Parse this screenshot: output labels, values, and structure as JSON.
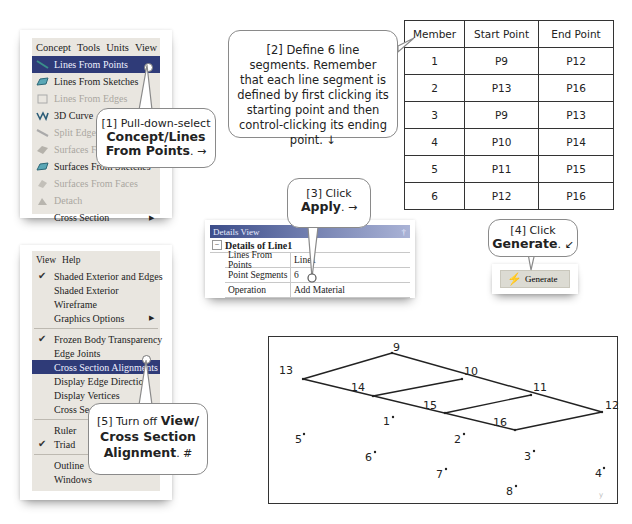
{
  "concept_menu": {
    "menubar": [
      "Concept",
      "Tools",
      "Units",
      "View"
    ],
    "items": [
      {
        "label": "Lines From Points",
        "state": "selected",
        "icon": "line-icon"
      },
      {
        "label": "Lines From Sketches",
        "state": "enabled",
        "icon": "sketch-lines-icon"
      },
      {
        "label": "Lines From Edges",
        "state": "disabled",
        "icon": "edge-lines-icon"
      },
      {
        "label": "3D Curve",
        "state": "enabled",
        "icon": "curve-icon"
      },
      {
        "label": "Split Edges",
        "state": "disabled",
        "icon": "split-edges-icon"
      },
      {
        "label": "Surfaces From Edges",
        "state": "disabled",
        "icon": "surface-edges-icon"
      },
      {
        "label": "Surfaces From Sketches",
        "state": "enabled",
        "icon": "surface-sketch-icon"
      },
      {
        "label": "Surfaces From Faces",
        "state": "disabled",
        "icon": "surface-faces-icon"
      },
      {
        "label": "Detach",
        "state": "disabled",
        "icon": "detach-icon"
      },
      {
        "label": "Cross Section",
        "state": "enabled",
        "submenu": true
      }
    ]
  },
  "view_menu": {
    "menubar": [
      "View",
      "Help"
    ],
    "groups": [
      [
        {
          "label": "Shaded Exterior and Edges",
          "checked": true
        },
        {
          "label": "Shaded Exterior",
          "checked": false
        },
        {
          "label": "Wireframe",
          "checked": false
        },
        {
          "label": "Graphics Options",
          "checked": false,
          "submenu": true
        }
      ],
      [
        {
          "label": "Frozen Body Transparency",
          "checked": true
        },
        {
          "label": "Edge Joints",
          "checked": false
        },
        {
          "label": "Cross Section Alignments",
          "checked": false,
          "selected": true
        },
        {
          "label": "Display Edge Direction",
          "checked": false
        },
        {
          "label": "Display Vertices",
          "checked": false
        },
        {
          "label": "Cross Section Solids",
          "checked": false
        }
      ],
      [
        {
          "label": "Ruler",
          "checked": false
        },
        {
          "label": "Triad",
          "checked": true
        }
      ],
      [
        {
          "label": "Outline",
          "checked": false
        },
        {
          "label": "Windows",
          "checked": false
        }
      ]
    ]
  },
  "callouts": {
    "c1": {
      "line1": "[1] Pull-down-select",
      "bold": "Concept/Lines From Points",
      "tail": ". →"
    },
    "c2": {
      "text": "[2] Define 6 line segments. Remember that each line segment is defined by first clicking its starting point and then control-clicking its ending point. ↓"
    },
    "c3": {
      "line1": "[3] Click",
      "bold": "Apply",
      "tail": ". →"
    },
    "c4": {
      "line1": "[4] Click",
      "bold": "Generate",
      "tail": ". ↙"
    },
    "c5": {
      "line1": "[5] Turn off ",
      "bold1": "View/",
      "bold2": "Cross Section",
      "bold3": "Alignment",
      "tail": ". #"
    }
  },
  "members_table": {
    "headers": [
      "Member",
      "Start Point",
      "End Point"
    ],
    "rows": [
      [
        "1",
        "P9",
        "P12"
      ],
      [
        "2",
        "P13",
        "P16"
      ],
      [
        "3",
        "P9",
        "P13"
      ],
      [
        "4",
        "P10",
        "P14"
      ],
      [
        "5",
        "P11",
        "P15"
      ],
      [
        "6",
        "P12",
        "P16"
      ]
    ]
  },
  "details_view": {
    "title": "Details View",
    "pin": "†",
    "section": "Details of Line1",
    "rows": [
      {
        "label": "Lines From Points",
        "value": "Line1"
      },
      {
        "label": "Point Segments",
        "value": "6"
      },
      {
        "label": "Operation",
        "value": "Add Material"
      }
    ]
  },
  "generate_button": {
    "label": "Generate"
  },
  "point_diagram": {
    "points": [
      {
        "id": "9",
        "x": 123,
        "y": 16
      },
      {
        "id": "10",
        "x": 193,
        "y": 42
      },
      {
        "id": "11",
        "x": 262,
        "y": 58
      },
      {
        "id": "12",
        "x": 333,
        "y": 75
      },
      {
        "id": "13",
        "x": 34,
        "y": 42
      },
      {
        "id": "14",
        "x": 104,
        "y": 59
      },
      {
        "id": "15",
        "x": 176,
        "y": 76
      },
      {
        "id": "16",
        "x": 246,
        "y": 93
      },
      {
        "id": "1",
        "x": 124,
        "y": 80
      },
      {
        "id": "2",
        "x": 195,
        "y": 97
      },
      {
        "id": "3",
        "x": 265,
        "y": 114
      },
      {
        "id": "4",
        "x": 335,
        "y": 131
      },
      {
        "id": "5",
        "x": 35,
        "y": 97
      },
      {
        "id": "6",
        "x": 106,
        "y": 115
      },
      {
        "id": "7",
        "x": 177,
        "y": 132
      },
      {
        "id": "8",
        "x": 247,
        "y": 149
      }
    ],
    "segments": [
      [
        "9",
        "12"
      ],
      [
        "13",
        "16"
      ],
      [
        "9",
        "13"
      ],
      [
        "10",
        "14"
      ],
      [
        "11",
        "15"
      ],
      [
        "12",
        "16"
      ]
    ]
  }
}
